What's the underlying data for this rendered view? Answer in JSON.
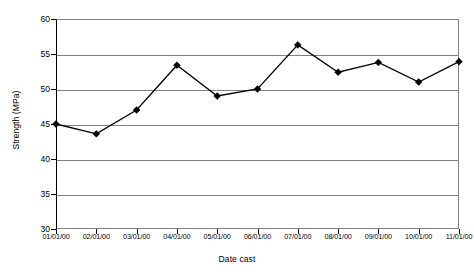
{
  "chart_data": {
    "type": "line",
    "title": "",
    "xlabel": "Date cast",
    "ylabel": "Strength (MPa)",
    "categories": [
      "01/01/00",
      "02/01/00",
      "03/01/00",
      "04/01/00",
      "05/01/00",
      "06/01/00",
      "07/01/00",
      "08/01/00",
      "09/01/00",
      "10/01/00",
      "11/01/00"
    ],
    "values": [
      45.0,
      43.6,
      47.0,
      53.4,
      49.0,
      50.0,
      56.3,
      52.4,
      53.8,
      51.0,
      53.9
    ],
    "series": [
      {
        "name": "Strength",
        "values": [
          45.0,
          43.6,
          47.0,
          53.4,
          49.0,
          50.0,
          56.3,
          52.4,
          53.8,
          51.0,
          53.9
        ]
      }
    ],
    "ylim": [
      30,
      60
    ],
    "yticks": [
      30,
      35,
      40,
      45,
      50,
      55,
      60
    ],
    "ytick_labels": [
      "30",
      "35",
      "40",
      "45",
      "50",
      "55",
      "60"
    ],
    "grid": "horizontal",
    "legend": "none",
    "marker": "diamond",
    "line_color": "#000000",
    "marker_color": "#000000",
    "gridline_color": "#808080",
    "plot_background": "#ffffff"
  }
}
